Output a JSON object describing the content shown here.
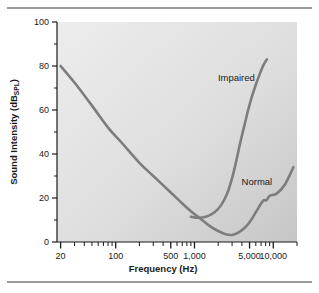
{
  "figure": {
    "name": "audiogram-threshold-curves",
    "top_rule": "divider",
    "bottom_rule": "divider"
  },
  "chart_data": {
    "type": "line",
    "title": "",
    "xlabel": "Frequency (Hz)",
    "ylabel": "Sound Intensity (dB",
    "ylabel_subscript": "SPL",
    "ylabel_suffix": ")",
    "xscale": "log",
    "yscale": "linear",
    "xlim": [
      18,
      20000
    ],
    "ylim": [
      0,
      100
    ],
    "grid": false,
    "legend": "inline-annotations",
    "xticks": [
      20,
      100,
      500,
      1000,
      5000,
      10000
    ],
    "xtick_labels": [
      "20",
      "100",
      "500",
      "1,000",
      "5,000",
      "10,000"
    ],
    "xminor_ticks": [
      30,
      40,
      50,
      60,
      70,
      80,
      90,
      200,
      300,
      400,
      600,
      700,
      800,
      900,
      2000,
      3000,
      4000,
      6000,
      7000,
      8000,
      9000,
      20000
    ],
    "yticks": [
      0,
      20,
      40,
      60,
      80,
      100
    ],
    "ytick_labels": [
      "0",
      "20",
      "40",
      "60",
      "80",
      "100"
    ],
    "yminor_ticks": [
      10,
      30,
      50,
      70,
      90
    ],
    "line_color": "#7d7d7d",
    "plot_bg_top_left": "#ececec",
    "plot_bg_bottom_right": "#c9c9c9",
    "series": [
      {
        "name": "Normal",
        "label": "Normal",
        "label_x": 6200,
        "label_y": 26,
        "x": [
          20,
          30,
          50,
          80,
          120,
          200,
          300,
          500,
          700,
          900,
          1200,
          1600,
          2000,
          2500,
          3000,
          3500,
          4200,
          5000,
          6000,
          7000,
          7600,
          8200,
          9000,
          11000,
          14000,
          18000
        ],
        "y": [
          80,
          72.5,
          62,
          52,
          45,
          36,
          30,
          22.5,
          17.5,
          14,
          10.5,
          7,
          5,
          3.5,
          3.2,
          4,
          6,
          9,
          13.5,
          17.5,
          19,
          19,
          21,
          22,
          26,
          34
        ]
      },
      {
        "name": "Impaired",
        "label": "Impaired",
        "label_x": 3400,
        "label_y": 73,
        "x": [
          900,
          1100,
          1400,
          1800,
          2200,
          2600,
          3000,
          3400,
          3800,
          4300,
          4800,
          5400,
          6000,
          6600,
          7200,
          7800,
          8300
        ],
        "y": [
          11.5,
          11,
          11.5,
          13.5,
          17,
          22,
          29,
          37,
          45,
          53,
          60,
          66.5,
          71.5,
          75.5,
          79,
          81.5,
          83
        ]
      }
    ]
  }
}
